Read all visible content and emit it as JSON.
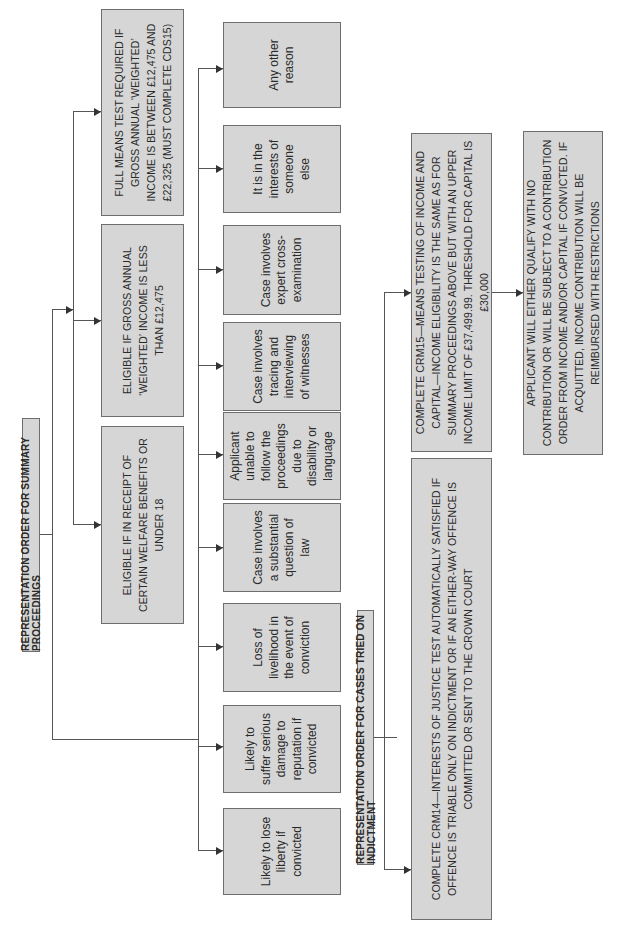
{
  "summary": {
    "title": "REPRESENTATION ORDER FOR SUMMARY PROCEEDINGS",
    "means_boxes": [
      {
        "text": "ELIGIBLE IF IN RECEIPT OF CERTAIN WELFARE BENEFITS OR UNDER 18"
      },
      {
        "text": "ELIGIBLE IF GROSS ANNUAL ‘WEIGHTED’ INCOME IS LESS THAN £12,475"
      },
      {
        "text": "FULL MEANS TEST REQUIRED IF GROSS ANNUAL ‘WEIGHTED’ INCOME IS BETWEEN £12,475 AND £22,325 (MUST COMPLETE CDS15)"
      }
    ],
    "interests_of_justice": [
      {
        "text": "Likely to lose liberty if convicted"
      },
      {
        "text": "Likely to suffer serious damage to reputation if convicted"
      },
      {
        "text": "Loss of livelihood in the event of conviction"
      },
      {
        "text": "Case involves a substantial question of law"
      },
      {
        "text": "Applicant unable to follow the proceedings due to disability or language"
      },
      {
        "text": "Case involves tracing and interviewing of witnesses"
      },
      {
        "text": "Case involves expert cross-examination"
      },
      {
        "text": "It is in the interests of someone else"
      },
      {
        "text": "Any other reason"
      }
    ]
  },
  "indictment": {
    "title": "REPRESENTATION ORDER FOR CASES TRIED ON INDICTMENT",
    "crm14": "COMPLETE CRM14—INTERESTS OF JUSTICE TEST AUTOMATICALLY SATISFIED IF OFFENCE IS TRIABLE ONLY ON INDICTMENT OR IF AN EITHER-WAY OFFENCE IS COMMITTED OR SENT TO THE CROWN COURT",
    "crm15": "COMPLETE CRM15—MEANS TESTING OF INCOME AND CAPITAL—INCOME ELIGIBILITY IS THE SAME AS FOR SUMMARY PROCEEDINGS ABOVE BUT WITH AN UPPER INCOME LIMIT OF £37,499.99. THRESHOLD FOR CAPITAL IS £30,000",
    "outcome": "APPLICANT WILL EITHER QUALIFY WITH NO CONTRIBUTION OR WILL BE SUBJECT TO A CONTRIBUTION ORDER FROM INCOME AND/OR CAPITAL IF CONVICTED. IF ACQUITTED, INCOME CONTRIBUTION WILL BE REIMBURSED WITH RESTRICTIONS"
  },
  "colors": {
    "box_fill": "#d6d6d6",
    "box_border": "#6e6e6e",
    "line": "#555555"
  }
}
